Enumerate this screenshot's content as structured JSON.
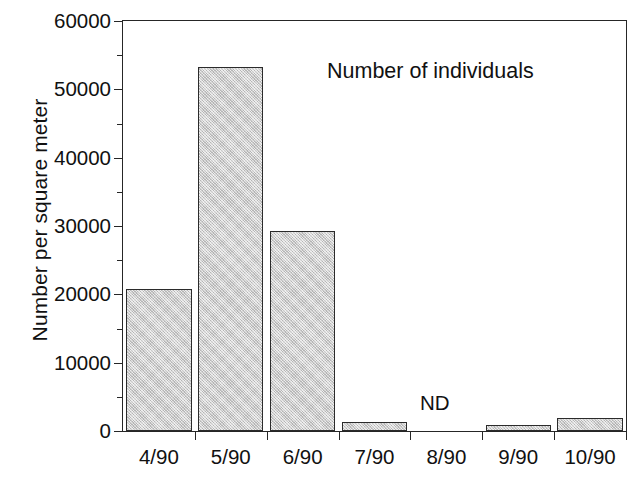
{
  "chart_data": {
    "type": "bar",
    "title": "",
    "annotation": "Number of individuals",
    "nd_label": "ND",
    "nd_category": "8/90",
    "xlabel": "",
    "ylabel": "Number per square meter",
    "categories": [
      "4/90",
      "5/90",
      "6/90",
      "7/90",
      "8/90",
      "9/90",
      "10/90"
    ],
    "values": [
      20800,
      53200,
      29200,
      1300,
      null,
      900,
      1900
    ],
    "ylim": [
      0,
      60000
    ],
    "ytick_labels": [
      "0",
      "10000",
      "20000",
      "30000",
      "40000",
      "50000",
      "60000"
    ],
    "ytick_values": [
      0,
      10000,
      20000,
      30000,
      40000,
      50000,
      60000
    ],
    "yminor_values": [
      5000,
      15000,
      25000,
      35000,
      45000,
      55000
    ],
    "grid": false,
    "legend": "none",
    "bar_fill_color": "#c9c9c9",
    "bar_edge_color": "#2b2b2b",
    "axis_color": "#262626"
  },
  "caption_remnant": ""
}
